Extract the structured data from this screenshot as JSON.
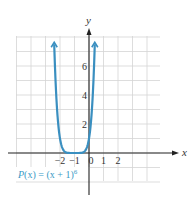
{
  "chart_data": {
    "type": "line",
    "title": "",
    "function_label": "P(x) = (x + 1)^6",
    "function_label_parts": {
      "main": "P(x) = (x + 1)",
      "exponent": "6"
    },
    "xlabel": "x",
    "ylabel": "y",
    "xlim": [
      -5,
      5
    ],
    "ylim": [
      -2,
      8
    ],
    "grid": true,
    "x_ticks": [
      {
        "value": -2,
        "label": "−2"
      },
      {
        "value": -1,
        "label": "−1"
      },
      {
        "value": 0,
        "label": "0"
      },
      {
        "value": 1,
        "label": "1"
      },
      {
        "value": 2,
        "label": "2"
      }
    ],
    "y_ticks": [
      {
        "value": 2,
        "label": "2"
      },
      {
        "value": 4,
        "label": "4"
      },
      {
        "value": 6,
        "label": "6"
      }
    ],
    "series": [
      {
        "name": "P(x) = (x + 1)^6",
        "color": "#3a8fc0",
        "x": [
          -2.4,
          -2.2,
          -2.0,
          -1.8,
          -1.6,
          -1.4,
          -1.2,
          -1.0,
          -0.8,
          -0.6,
          -0.4,
          -0.2,
          0.0,
          0.2,
          0.4
        ],
        "values": [
          7.53,
          2.99,
          1.0,
          0.26,
          0.05,
          0.004,
          0.0001,
          0,
          0.0001,
          0.004,
          0.05,
          0.26,
          1.0,
          2.99,
          7.53
        ]
      }
    ],
    "annotations": [
      "arrowheads at both upper ends of curve",
      "vertex at (-1, 0)"
    ]
  },
  "colors": {
    "curve": "#3a8fc0",
    "label": "#3a9bc6",
    "grid": "#d4d4d4",
    "axis": "#222222"
  }
}
